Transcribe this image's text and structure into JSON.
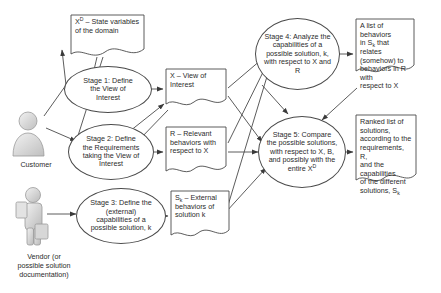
{
  "diagram": {
    "stroke_color": "#4a4a4a",
    "text_color": "#2b2b2b",
    "background": "#ffffff"
  },
  "actors": [
    {
      "id": "customer",
      "icon": "person-icon",
      "caption": "Customer"
    },
    {
      "id": "vendor",
      "icon": "person-with-briefcase-icon",
      "caption": "Vendor (or possible solution documentation)",
      "caption_lines": [
        "Vendor (or",
        "possible solution",
        "documentation)"
      ]
    }
  ],
  "stages": [
    {
      "id": "stage1",
      "label": "Stage 1: Define the View of Interest",
      "lines": [
        "Stage 1: Define",
        "the View of",
        "Interest"
      ]
    },
    {
      "id": "stage2",
      "label": "Stage 2: Define the Requirements taking the View of Interest",
      "lines": [
        "Stage 2: Define",
        "the Requirements",
        "taking the View of",
        "Interest"
      ]
    },
    {
      "id": "stage3",
      "label": "Stage 3: Define the (external) capabilities of a possible solution, k",
      "lines": [
        "Stage 3: Define the",
        "(external)",
        "capabilities of a",
        "possible solution, k"
      ]
    },
    {
      "id": "stage4",
      "label": "Stage 4: Analyze the capabilities of a possible solution, k, with respect to X and R",
      "lines": [
        "Stage 4: Analyze the",
        "capabilities of a",
        "possible solution, k,",
        "with respect to X and",
        "R"
      ]
    },
    {
      "id": "stage5",
      "label": "Stage 5: Compare the possible solutions, with respect to X, B, and possibly with the entire XD",
      "lines": [
        "Stage 5: Compare",
        "the possible solutions,",
        "with respect to X, B,",
        "and possibly with the",
        "entire X"
      ]
    }
  ],
  "artifacts": {
    "domain_state": {
      "id": "doc-domain-state",
      "label": "XD – State variables of the domain",
      "line1_prefix": "X",
      "line1_sup": "D",
      "line1_rest": " – State variables",
      "line2": "of the domain"
    },
    "view_of_interest": {
      "id": "doc-view-of-interest",
      "label": "X – View of Interest",
      "line1": "X – View of",
      "line2": "Interest"
    },
    "relevant_behaviors": {
      "id": "doc-relevant-behaviors",
      "label": "R – Relevant behaviors with respect to X",
      "line1": "R – Relevant",
      "line2": "behaviors with",
      "line3": "respect to X"
    },
    "external_behaviors": {
      "id": "doc-external-behaviors",
      "label": "Sk – External behaviors of solution k",
      "line1_prefix": "S",
      "line1_sub": "k",
      "line1_rest": " – External",
      "line2": "behaviors of",
      "line3": "solution k"
    },
    "behavior_list": {
      "id": "doc-behavior-list",
      "label": "A list of behaviors in Sk that relates (somehow) to behaviors in R with respect to X",
      "line1": "A list of behaviors",
      "line2_prefix": "in S",
      "line2_sub": "k",
      "line2_rest": " that relates",
      "line3": "(somehow) to",
      "line4": "behaviors in R with",
      "line5": "respect to X"
    },
    "ranked_list": {
      "id": "doc-ranked-list",
      "label": "Ranked list of solutions, according to the requirements, R, and the capabilities of the different solutions, Sk",
      "line1": "Ranked list of",
      "line2": "solutions,",
      "line3": "according to the",
      "line4": "requirements, R,",
      "line5": "and the capabilities",
      "line6": "of the different",
      "line7_prefix": "solutions, S",
      "line7_sub": "k"
    }
  },
  "stage5_superscript": "D"
}
